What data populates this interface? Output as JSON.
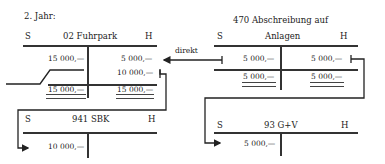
{
  "heading": "2. Jahr:",
  "arrow_label": "direkt",
  "accounts": {
    "fuhrpark": {
      "soll": "S",
      "haben": "H",
      "title": "02 Fuhrpark",
      "debit": [
        "15 000,—"
      ],
      "credit": [
        "5 000,—",
        "10 000,—"
      ],
      "debit_total": "15 000,—",
      "credit_total": "15 000,—"
    },
    "abschreibung": {
      "soll": "S",
      "haben": "H",
      "title_line1": "470 Abschreibung auf",
      "title_line2": "Anlagen",
      "debit": [
        "5 000,—"
      ],
      "credit": [
        "5 000,—"
      ],
      "debit_total": "5 000,—",
      "credit_total": "5 000,—"
    },
    "sbk": {
      "soll": "S",
      "haben": "H",
      "title": "941 SBK",
      "debit": [
        "10 000,—"
      ]
    },
    "guv": {
      "soll": "S",
      "haben": "H",
      "title": "93 G+V",
      "debit": [
        "5 000,—"
      ]
    }
  }
}
